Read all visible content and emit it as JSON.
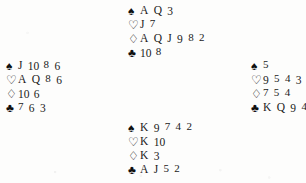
{
  "document": {
    "kind": "bridge-hand-diagram",
    "background_color": "#fdfdfc",
    "ink_color": "#101010"
  },
  "suits": {
    "spade": {
      "name": "spade",
      "glyph": "♠",
      "style": "filled"
    },
    "heart": {
      "name": "heart",
      "glyph": "♡",
      "style": "hollow"
    },
    "diamond": {
      "name": "diamond",
      "glyph": "♢",
      "style": "hollow"
    },
    "club": {
      "name": "club",
      "glyph": "♣",
      "style": "filled"
    }
  },
  "hands": {
    "north": {
      "position": "north",
      "spades": "A Q 3",
      "hearts": "J 7",
      "diamonds": "A Q J 9 8 2",
      "clubs": "10 8"
    },
    "west": {
      "position": "west",
      "spades": "J 10 8 6",
      "hearts": "A Q 8 6",
      "diamonds": "10 6",
      "clubs": "7 6 3"
    },
    "east": {
      "position": "east",
      "spades": "5",
      "hearts": "9 5 4 3 2",
      "diamonds": "7 5 4",
      "clubs": "K Q 9 4"
    },
    "south": {
      "position": "south",
      "spades": "K 9 7 4 2",
      "hearts": "K 10",
      "diamonds": "K 3",
      "clubs": "A J 5 2"
    }
  }
}
